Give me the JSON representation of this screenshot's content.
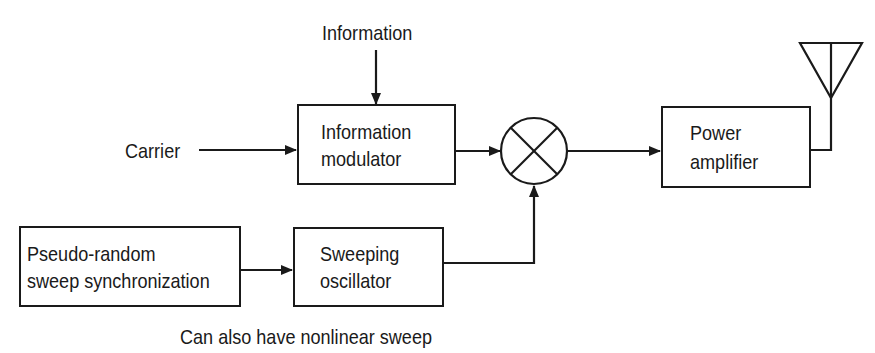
{
  "diagram": {
    "inputs": {
      "information": "Information",
      "carrier": "Carrier"
    },
    "blocks": {
      "information_modulator": {
        "line1": "Information",
        "line2": "modulator"
      },
      "mixer": {
        "symbol": "multiplier (circle with X)"
      },
      "power_amplifier": {
        "line1": "Power",
        "line2": "amplifier"
      },
      "pseudo_random": {
        "line1": "Pseudo-random",
        "line2": "sweep synchronization"
      },
      "sweeping_oscillator": {
        "line1": "Sweeping",
        "line2": "oscillator"
      },
      "antenna": {
        "symbol": "antenna"
      }
    },
    "caption": "Can also have nonlinear sweep",
    "connections": [
      {
        "from": "Information",
        "to": "Information modulator"
      },
      {
        "from": "Carrier",
        "to": "Information modulator"
      },
      {
        "from": "Information modulator",
        "to": "Mixer"
      },
      {
        "from": "Mixer",
        "to": "Power amplifier"
      },
      {
        "from": "Power amplifier",
        "to": "Antenna"
      },
      {
        "from": "Pseudo-random sweep synchronization",
        "to": "Sweeping oscillator"
      },
      {
        "from": "Sweeping oscillator",
        "to": "Mixer"
      }
    ]
  }
}
